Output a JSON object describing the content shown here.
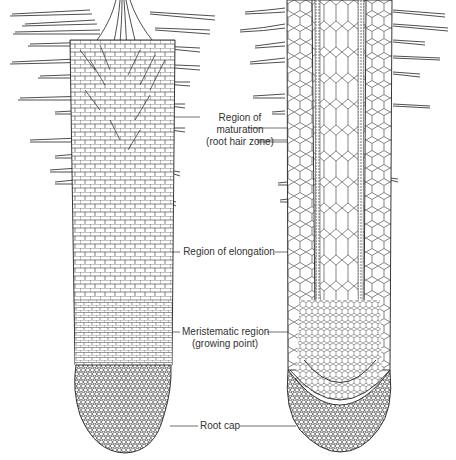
{
  "figure": {
    "stroke_color": "#222222",
    "background": "#ffffff"
  },
  "labels": [
    {
      "id": "maturation",
      "lines": [
        "Region of",
        "maturation",
        "(root hair zone)"
      ]
    },
    {
      "id": "elongation",
      "lines": [
        "Region of elongation"
      ]
    },
    {
      "id": "meristematic",
      "lines": [
        "Meristematic region",
        "(growing point)"
      ]
    },
    {
      "id": "rootcap",
      "lines": [
        "Root cap"
      ]
    }
  ]
}
